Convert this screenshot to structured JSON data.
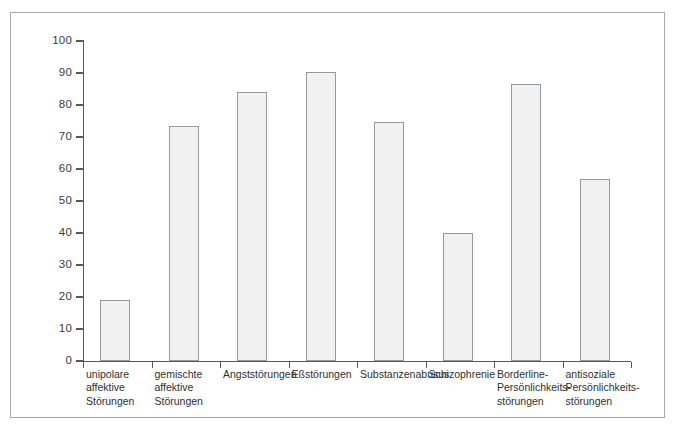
{
  "chart_data": {
    "type": "bar",
    "title": "",
    "subtitle": "",
    "xlabel": "",
    "ylabel": "",
    "ylim": [
      0,
      100
    ],
    "yticks": [
      0,
      10,
      20,
      30,
      40,
      50,
      60,
      70,
      80,
      90,
      100
    ],
    "ytick_labels": [
      "0",
      "10",
      "20",
      "30",
      "40",
      "50",
      "60",
      "70",
      "80",
      "90",
      "100"
    ],
    "grid": false,
    "legend": null,
    "categories": [
      "unipolare affektive Störungen",
      "gemischte affektive Störungen",
      "Angststörungen",
      "Eßstörungen",
      "Substanzenabusus",
      "Schizophrenie",
      "Borderline-Persönlichkeitsstörungen",
      "antisoziale Persönlichkeitsstörungen"
    ],
    "category_lines": [
      [
        "unipolare",
        "affektive",
        "Störungen"
      ],
      [
        "gemischte",
        "affektive",
        "Störungen"
      ],
      [
        "Angststörungen"
      ],
      [
        "Eßstörungen"
      ],
      [
        "Substanzenabusus"
      ],
      [
        "Schizophrenie"
      ],
      [
        "Borderline-",
        "Persönlichkeits-",
        "störungen"
      ],
      [
        "antisoziale",
        "Persönlichkeits-",
        "störungen"
      ]
    ],
    "values": [
      19,
      73.5,
      84,
      90.3,
      74.7,
      40,
      86.6,
      57
    ],
    "bar_color": "#f1f1f1",
    "bar_border_color": "#969a9c",
    "axis_color": "#55595c",
    "frame_color": "#a8a8a8"
  },
  "caption": ""
}
